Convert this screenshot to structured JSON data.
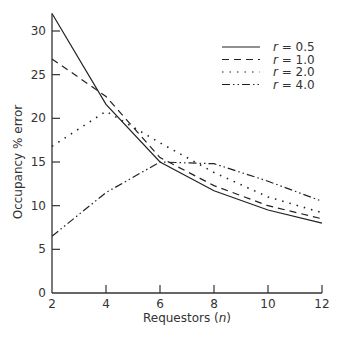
{
  "chart_data": {
    "type": "line",
    "title": "",
    "xlabel": "Requestors (n)",
    "ylabel": "Occupancy % error",
    "x": [
      2,
      4,
      6,
      8,
      10,
      12
    ],
    "xticks": [
      2,
      4,
      6,
      8,
      10,
      12
    ],
    "yticks": [
      0,
      5,
      10,
      15,
      20,
      25,
      30
    ],
    "xlim": [
      2,
      12
    ],
    "ylim": [
      0,
      32
    ],
    "grid": false,
    "legend_position": "upper right",
    "series": [
      {
        "name": "r = 0.5",
        "style": "solid",
        "values": [
          32.0,
          21.6,
          15.0,
          11.7,
          9.5,
          8.0
        ]
      },
      {
        "name": "r = 1.0",
        "style": "dashed",
        "values": [
          26.8,
          22.5,
          15.5,
          12.3,
          10.0,
          8.5
        ]
      },
      {
        "name": "r = 2.0",
        "style": "dotted",
        "values": [
          16.8,
          20.8,
          17.2,
          13.8,
          11.0,
          9.2
        ]
      },
      {
        "name": "r = 4.0",
        "style": "dash-dot",
        "values": [
          6.5,
          11.5,
          15.0,
          14.8,
          12.8,
          10.5
        ]
      }
    ]
  },
  "axes": {
    "xlabel_main": "Requestors (",
    "xlabel_var": "n",
    "xlabel_end": ")",
    "ylabel": "Occupancy % error"
  },
  "legend": [
    {
      "var": "r",
      "eq": " = 0.5"
    },
    {
      "var": "r",
      "eq": " = 1.0"
    },
    {
      "var": "r",
      "eq": " = 2.0"
    },
    {
      "var": "r",
      "eq": " = 4.0"
    }
  ]
}
